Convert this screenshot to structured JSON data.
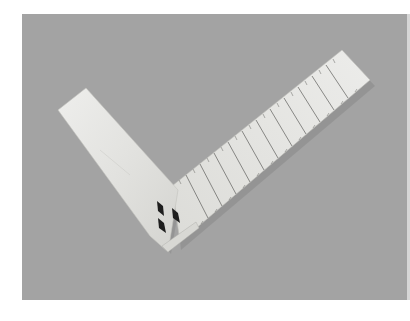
{
  "image": {
    "subject": "Bone try square with ruler graduations and inlaid diamond decorations",
    "background_color": "#a3a3a3",
    "object_color": "#e6e6e4",
    "inlay_color": "#1e1e1e",
    "inlays": [
      "diamond",
      "diamond",
      "diamond"
    ],
    "blade_major_graduations": 12
  }
}
